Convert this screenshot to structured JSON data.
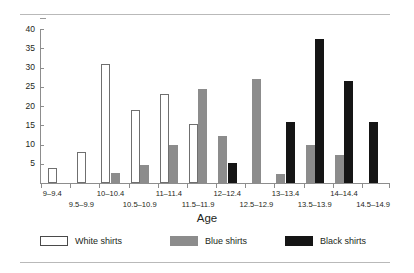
{
  "chart_data": {
    "type": "bar",
    "title": "",
    "xlabel": "Age",
    "ylabel": "Percent",
    "ylim": [
      0,
      40
    ],
    "yticks": [
      0,
      5,
      10,
      15,
      20,
      25,
      30,
      35,
      40
    ],
    "ytick_labels": [
      "",
      "5",
      "10",
      "15",
      "20",
      "25",
      "30",
      "35",
      "40"
    ],
    "grid": false,
    "legend_position": "bottom",
    "categories": [
      "9–9.4",
      "9.5–9.9",
      "10–10.4",
      "10.5–10.9",
      "11–11.4",
      "11.5–11.9",
      "12–12.4",
      "12.5–12.9",
      "13–13.4",
      "13.5–13.9",
      "14–14.4",
      "14.5–14.9"
    ],
    "series": [
      {
        "name": "White shirts",
        "color": "#ffffff",
        "values": [
          3.8,
          8.0,
          30.8,
          19.0,
          23.0,
          15.3,
          0,
          0,
          0,
          0,
          0,
          0
        ]
      },
      {
        "name": "Blue shirts",
        "color": "#8c8c8c",
        "values": [
          0,
          0,
          2.5,
          4.8,
          9.8,
          24.3,
          12.2,
          27.0,
          2.4,
          9.9,
          7.4,
          0
        ]
      },
      {
        "name": "Black shirts",
        "color": "#151515",
        "values": [
          0,
          0,
          0,
          0,
          0,
          0,
          5.2,
          0,
          15.8,
          37.4,
          26.4,
          15.8
        ]
      }
    ]
  },
  "axis": {
    "y_title": "Percent",
    "x_title": "Age",
    "y_labels": [
      "40",
      "35",
      "30",
      "25",
      "20",
      "15",
      "10",
      "5"
    ]
  },
  "legend": {
    "items": [
      {
        "label": "White shirts",
        "swatch": "white"
      },
      {
        "label": "Blue shirts",
        "swatch": "blue"
      },
      {
        "label": "Black shirts",
        "swatch": "black"
      }
    ]
  },
  "colors": {
    "white_bar": "#ffffff",
    "blue_bar": "#8c8c8c",
    "black_bar": "#151515",
    "axis": "#8d8d8d",
    "rule": "#b9b9b9",
    "text": "#231f20"
  }
}
